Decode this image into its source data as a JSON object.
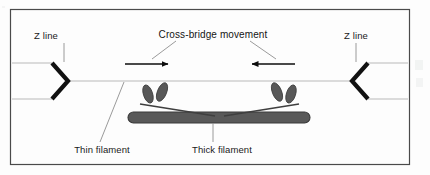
{
  "figure": {
    "kind": "diagram",
    "background_color": "#fdfdfd",
    "border_color": "#4a4a4a",
    "frame": {
      "x": 10,
      "y": 9,
      "width": 400,
      "height": 156
    }
  },
  "labels": {
    "z_line_left": "Z line",
    "z_line_right": "Z line",
    "crossbridge_title": "Cross-bridge movement",
    "thin_filament": "Thin filament",
    "thick_filament": "Thick filament"
  },
  "colors": {
    "z_line": "#111111",
    "thin_filament": "#b9b9b9",
    "thick_filament_fill": "#595959",
    "thick_filament_stroke": "#3a3a3a",
    "myosin_head_fill": "#585858",
    "myosin_head_stroke": "#3c3c3c",
    "arrow": "#0d0d0d",
    "leader_line": "#9a9a9a",
    "text": "#1a1a1a"
  },
  "geometry": {
    "z_line_left": {
      "apex_x": 68,
      "apex_y": 81,
      "top_x": 52,
      "top_y": 63,
      "bottom_x": 52,
      "bottom_y": 99
    },
    "z_line_right": {
      "apex_x": 352,
      "apex_y": 81,
      "top_x": 368,
      "top_y": 63,
      "bottom_x": 368,
      "bottom_y": 99
    },
    "thin_filaments": [
      {
        "x1": 12,
        "y1": 63,
        "x2": 52,
        "y2": 63
      },
      {
        "x1": 12,
        "y1": 99,
        "x2": 52,
        "y2": 99
      },
      {
        "x1": 68,
        "y1": 81,
        "x2": 352,
        "y2": 81
      },
      {
        "x1": 368,
        "y1": 63,
        "x2": 408,
        "y2": 63
      },
      {
        "x1": 368,
        "y1": 99,
        "x2": 408,
        "y2": 99
      }
    ],
    "thick_filament": {
      "x": 128,
      "y": 112,
      "width": 182,
      "height": 11,
      "radius": 5.5
    },
    "arrows": [
      {
        "name": "left-arrow",
        "x1": 125,
        "y1": 64,
        "x2": 170,
        "y2": 64,
        "direction": "right"
      },
      {
        "name": "right-arrow",
        "x1": 295,
        "y1": 64,
        "x2": 250,
        "y2": 64,
        "direction": "left"
      }
    ],
    "myosin_heads": [
      {
        "cx": 148,
        "cy": 94,
        "rx": 4.6,
        "ry": 9.4,
        "rotate": -18
      },
      {
        "cx": 162,
        "cy": 92,
        "rx": 4.6,
        "ry": 9.8,
        "rotate": 22
      },
      {
        "cx": 291,
        "cy": 94,
        "rx": 4.6,
        "ry": 9.4,
        "rotate": 18
      },
      {
        "cx": 277,
        "cy": 92,
        "rx": 4.6,
        "ry": 9.8,
        "rotate": -22
      }
    ],
    "label_positions": {
      "z_line_left": {
        "x": 46,
        "y": 39
      },
      "z_line_right": {
        "x": 347,
        "y": 39
      },
      "crossbridge_title": {
        "x": 160,
        "y": 38
      },
      "thin_filament": {
        "x": 66,
        "y": 151
      },
      "thick_filament": {
        "x": 186,
        "y": 151
      }
    },
    "leader_lines": [
      {
        "name": "z-line-left-leader",
        "x1": 64,
        "y1": 43,
        "x2": 64,
        "y2": 62
      },
      {
        "name": "z-line-right-leader",
        "x1": 356,
        "y1": 43,
        "x2": 356,
        "y2": 62
      },
      {
        "name": "crossbridge-left-leader",
        "x1": 176,
        "y1": 41,
        "x2": 152,
        "y2": 59
      },
      {
        "name": "crossbridge-right-leader",
        "x1": 250,
        "y1": 41,
        "x2": 276,
        "y2": 59
      },
      {
        "name": "thin-filament-leader",
        "x1": 100,
        "y1": 142,
        "x2": 124,
        "y2": 82
      },
      {
        "name": "thick-filament-leader",
        "x1": 213,
        "y1": 142,
        "x2": 213,
        "y2": 122
      }
    ]
  }
}
